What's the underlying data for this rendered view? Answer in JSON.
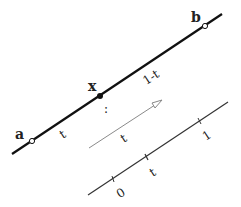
{
  "diagram": {
    "colors": {
      "main_line": "#111111",
      "arrow_line": "#8a8a8a",
      "number_line": "#333333",
      "background": "#ffffff"
    },
    "main_segment": {
      "start_label": "a",
      "end_label": "b",
      "point_label": "x",
      "left_part_label": "t",
      "right_part_label": "1-t",
      "dots_label": ":"
    },
    "arrow": {
      "label": "t"
    },
    "number_line": {
      "ticks": [
        {
          "label": "0"
        },
        {
          "label": "t"
        },
        {
          "label": "1"
        }
      ]
    }
  }
}
